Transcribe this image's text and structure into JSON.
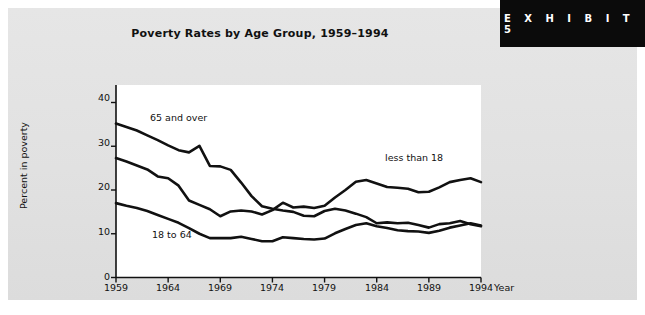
{
  "exhibit": {
    "banner_label": "E X H I B I T   5"
  },
  "chart_data": {
    "type": "line",
    "title": "Poverty Rates by Age Group, 1959–1994",
    "xlabel": "Year",
    "ylabel": "Percent in poverty",
    "xlim": [
      1959,
      1994
    ],
    "ylim": [
      0,
      44
    ],
    "yticks": [
      0,
      10,
      20,
      30,
      40
    ],
    "xticks": [
      1959,
      1964,
      1969,
      1974,
      1979,
      1984,
      1989,
      1994
    ],
    "grid": false,
    "legend_position": "inline-annotations",
    "x": [
      1959,
      1960,
      1961,
      1962,
      1963,
      1964,
      1965,
      1966,
      1967,
      1968,
      1969,
      1970,
      1971,
      1972,
      1973,
      1974,
      1975,
      1976,
      1977,
      1978,
      1979,
      1980,
      1981,
      1982,
      1983,
      1984,
      1985,
      1986,
      1987,
      1988,
      1989,
      1990,
      1991,
      1992,
      1993,
      1994
    ],
    "series": [
      {
        "name": "65 and over",
        "label": "65 and over",
        "values": [
          35.2,
          34.4,
          33.6,
          32.5,
          31.4,
          30.2,
          29.1,
          28.6,
          30.1,
          25.5,
          25.4,
          24.6,
          21.7,
          18.6,
          16.3,
          15.7,
          15.3,
          15.0,
          14.1,
          14.0,
          15.2,
          15.7,
          15.3,
          14.6,
          13.8,
          12.4,
          12.6,
          12.4,
          12.5,
          12.0,
          11.4,
          12.2,
          12.4,
          12.9,
          12.2,
          11.7
        ]
      },
      {
        "name": "less than 18",
        "label": "less than 18",
        "values": [
          27.3,
          26.5,
          25.6,
          24.7,
          23.1,
          22.7,
          21.0,
          17.6,
          16.6,
          15.6,
          14.0,
          15.1,
          15.3,
          15.1,
          14.4,
          15.4,
          17.1,
          16.0,
          16.2,
          15.9,
          16.4,
          18.3,
          20.0,
          21.9,
          22.3,
          21.5,
          20.7,
          20.5,
          20.3,
          19.5,
          19.6,
          20.6,
          21.8,
          22.3,
          22.7,
          21.8
        ]
      },
      {
        "name": "18 to 64",
        "label": "18 to 64",
        "values": [
          17.0,
          16.4,
          15.9,
          15.2,
          14.3,
          13.4,
          12.5,
          11.3,
          10.0,
          9.0,
          9.0,
          9.0,
          9.3,
          8.8,
          8.3,
          8.3,
          9.2,
          9.0,
          8.8,
          8.7,
          8.9,
          10.1,
          11.1,
          12.0,
          12.4,
          11.7,
          11.3,
          10.8,
          10.6,
          10.5,
          10.2,
          10.7,
          11.4,
          11.9,
          12.4,
          11.9
        ]
      }
    ]
  }
}
